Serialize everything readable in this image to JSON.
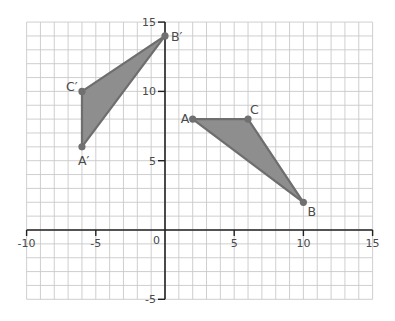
{
  "chart_data": {
    "type": "scatter",
    "title": "",
    "xlabel": "",
    "ylabel": "",
    "xlim": [
      -10,
      15
    ],
    "ylim": [
      -5,
      15
    ],
    "grid": true,
    "grid_step": 1,
    "x_ticks": [
      -10,
      -5,
      0,
      5,
      10,
      15
    ],
    "y_ticks": [
      -5,
      5,
      10,
      15
    ],
    "x_tick_labels": [
      "-10",
      "-5",
      "0",
      "5",
      "10",
      "15"
    ],
    "y_tick_labels": [
      "-5",
      "5",
      "10",
      "15"
    ],
    "origin_label": "0",
    "series": [
      {
        "name": "Triangle ABC",
        "shape": "polygon",
        "points": [
          {
            "label": "A",
            "x": 2,
            "y": 8
          },
          {
            "label": "B",
            "x": 10,
            "y": 2
          },
          {
            "label": "C",
            "x": 6,
            "y": 8
          }
        ]
      },
      {
        "name": "Triangle A'B'C'",
        "shape": "polygon",
        "points": [
          {
            "label": "A′",
            "x": -6,
            "y": 6
          },
          {
            "label": "B′",
            "x": 0,
            "y": 14
          },
          {
            "label": "C′",
            "x": -6,
            "y": 10
          }
        ]
      }
    ],
    "colors": {
      "fill": "#8e8e8e",
      "edge": "#6e6e6e",
      "vertex": "#707070",
      "grid": "#c9c9c9",
      "axis": "#222222",
      "text": "#4a4a4a"
    }
  }
}
